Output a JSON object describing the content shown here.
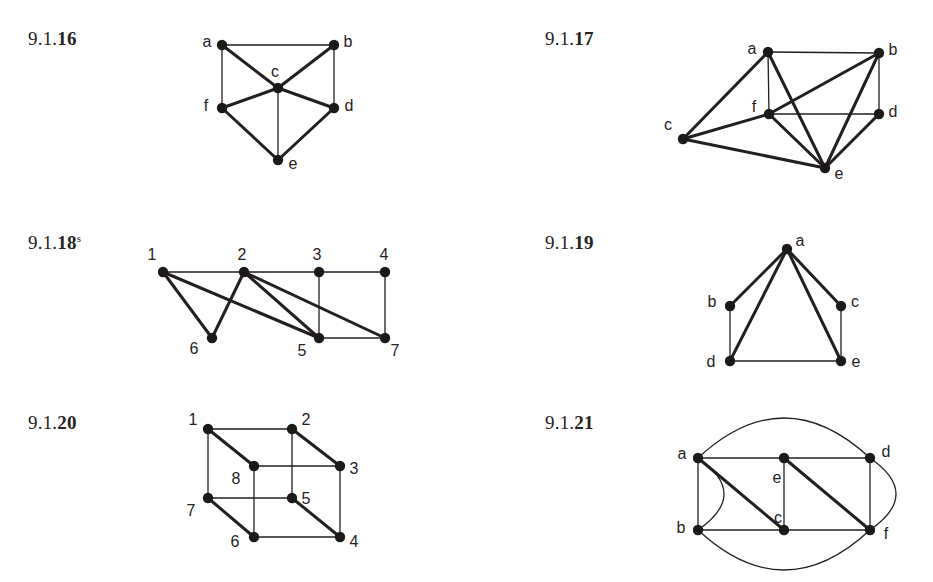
{
  "page": {
    "width": 933,
    "height": 582,
    "background": "#ffffff",
    "ink": "#231f20",
    "node_fill": "#1c1a18",
    "node_radius": 5.2,
    "thin_stroke": 1.3,
    "thick_stroke": 3.0
  },
  "figures": [
    {
      "id": "fig-9-1-16",
      "label_prefix": "9.1.",
      "label_number": "16",
      "label_sup": "",
      "label_x": 28,
      "label_y": 28,
      "vertices": [
        {
          "name": "a",
          "x": 222,
          "y": 45,
          "lx": 207,
          "ly": 43
        },
        {
          "name": "b",
          "x": 334,
          "y": 45,
          "lx": 348,
          "ly": 43
        },
        {
          "name": "c",
          "x": 278,
          "y": 88,
          "lx": 275,
          "ly": 73
        },
        {
          "name": "f",
          "x": 222,
          "y": 108,
          "lx": 206,
          "ly": 107
        },
        {
          "name": "d",
          "x": 334,
          "y": 108,
          "lx": 349,
          "ly": 107
        },
        {
          "name": "e",
          "x": 278,
          "y": 160,
          "lx": 293,
          "ly": 165
        }
      ],
      "edges": [
        {
          "from": "a",
          "to": "b",
          "w": "thin"
        },
        {
          "from": "a",
          "to": "f",
          "w": "thin"
        },
        {
          "from": "b",
          "to": "d",
          "w": "thin"
        },
        {
          "from": "a",
          "to": "c",
          "w": "thick"
        },
        {
          "from": "b",
          "to": "c",
          "w": "thick"
        },
        {
          "from": "c",
          "to": "f",
          "w": "thick"
        },
        {
          "from": "c",
          "to": "d",
          "w": "thick"
        },
        {
          "from": "c",
          "to": "e",
          "w": "thin"
        },
        {
          "from": "f",
          "to": "e",
          "w": "thick"
        },
        {
          "from": "d",
          "to": "e",
          "w": "thick"
        }
      ],
      "curves": []
    },
    {
      "id": "fig-9-1-17",
      "label_prefix": "9.1.",
      "label_number": "17",
      "label_sup": "",
      "label_x": 545,
      "label_y": 28,
      "vertices": [
        {
          "name": "a",
          "x": 768,
          "y": 52,
          "lx": 752,
          "ly": 50
        },
        {
          "name": "b",
          "x": 879,
          "y": 53,
          "lx": 893,
          "ly": 51
        },
        {
          "name": "c",
          "x": 683,
          "y": 139,
          "lx": 668,
          "ly": 126
        },
        {
          "name": "f",
          "x": 769,
          "y": 114,
          "lx": 754,
          "ly": 108
        },
        {
          "name": "d",
          "x": 879,
          "y": 114,
          "lx": 893,
          "ly": 113
        },
        {
          "name": "e",
          "x": 825,
          "y": 168,
          "lx": 839,
          "ly": 175
        }
      ],
      "edges": [
        {
          "from": "a",
          "to": "b",
          "w": "thin"
        },
        {
          "from": "a",
          "to": "f",
          "w": "thin"
        },
        {
          "from": "b",
          "to": "d",
          "w": "thin"
        },
        {
          "from": "f",
          "to": "d",
          "w": "thin"
        },
        {
          "from": "a",
          "to": "c",
          "w": "thick"
        },
        {
          "from": "a",
          "to": "e",
          "w": "thick"
        },
        {
          "from": "b",
          "to": "f",
          "w": "thick"
        },
        {
          "from": "b",
          "to": "e",
          "w": "thick"
        },
        {
          "from": "c",
          "to": "f",
          "w": "thick"
        },
        {
          "from": "c",
          "to": "e",
          "w": "thick"
        },
        {
          "from": "f",
          "to": "e",
          "w": "thick"
        },
        {
          "from": "d",
          "to": "e",
          "w": "thick"
        }
      ],
      "curves": []
    },
    {
      "id": "fig-9-1-18",
      "label_prefix": "9.1.",
      "label_number": "18",
      "label_sup": "s",
      "label_x": 28,
      "label_y": 232,
      "vertices": [
        {
          "name": "1",
          "x": 163,
          "y": 272,
          "lx": 152,
          "ly": 256
        },
        {
          "name": "2",
          "x": 244,
          "y": 272,
          "lx": 242,
          "ly": 256
        },
        {
          "name": "3",
          "x": 319,
          "y": 272,
          "lx": 317,
          "ly": 256
        },
        {
          "name": "4",
          "x": 385,
          "y": 272,
          "lx": 384,
          "ly": 256
        },
        {
          "name": "6",
          "x": 212,
          "y": 338,
          "lx": 194,
          "ly": 350
        },
        {
          "name": "5",
          "x": 319,
          "y": 338,
          "lx": 302,
          "ly": 352
        },
        {
          "name": "7",
          "x": 385,
          "y": 338,
          "lx": 395,
          "ly": 352
        }
      ],
      "edges": [
        {
          "from": "1",
          "to": "2",
          "w": "thin"
        },
        {
          "from": "2",
          "to": "3",
          "w": "thin"
        },
        {
          "from": "3",
          "to": "4",
          "w": "thin"
        },
        {
          "from": "3",
          "to": "5",
          "w": "thin"
        },
        {
          "from": "4",
          "to": "7",
          "w": "thin"
        },
        {
          "from": "5",
          "to": "7",
          "w": "thin"
        },
        {
          "from": "1",
          "to": "6",
          "w": "thick"
        },
        {
          "from": "2",
          "to": "6",
          "w": "thick"
        },
        {
          "from": "1",
          "to": "5",
          "w": "thick"
        },
        {
          "from": "2",
          "to": "5",
          "w": "thick"
        },
        {
          "from": "2",
          "to": "7",
          "w": "thick"
        }
      ],
      "curves": []
    },
    {
      "id": "fig-9-1-19",
      "label_prefix": "9.1.",
      "label_number": "19",
      "label_sup": "",
      "label_x": 545,
      "label_y": 232,
      "vertices": [
        {
          "name": "a",
          "x": 787,
          "y": 249,
          "lx": 800,
          "ly": 242
        },
        {
          "name": "b",
          "x": 730,
          "y": 306,
          "lx": 712,
          "ly": 303
        },
        {
          "name": "c",
          "x": 841,
          "y": 306,
          "lx": 855,
          "ly": 303
        },
        {
          "name": "d",
          "x": 730,
          "y": 361,
          "lx": 711,
          "ly": 363
        },
        {
          "name": "e",
          "x": 841,
          "y": 361,
          "lx": 856,
          "ly": 363
        }
      ],
      "edges": [
        {
          "from": "b",
          "to": "d",
          "w": "thin"
        },
        {
          "from": "c",
          "to": "e",
          "w": "thin"
        },
        {
          "from": "d",
          "to": "e",
          "w": "thin"
        },
        {
          "from": "a",
          "to": "b",
          "w": "thick"
        },
        {
          "from": "a",
          "to": "c",
          "w": "thick"
        },
        {
          "from": "a",
          "to": "d",
          "w": "thick"
        },
        {
          "from": "a",
          "to": "e",
          "w": "thick"
        }
      ],
      "curves": []
    },
    {
      "id": "fig-9-1-20",
      "label_prefix": "9.1.",
      "label_number": "20",
      "label_sup": "",
      "label_x": 28,
      "label_y": 412,
      "vertices": [
        {
          "name": "1",
          "x": 208,
          "y": 429,
          "lx": 193,
          "ly": 421
        },
        {
          "name": "2",
          "x": 292,
          "y": 429,
          "lx": 306,
          "ly": 421
        },
        {
          "name": "3",
          "x": 340,
          "y": 466,
          "lx": 354,
          "ly": 470
        },
        {
          "name": "8",
          "x": 254,
          "y": 466,
          "lx": 236,
          "ly": 480
        },
        {
          "name": "7",
          "x": 208,
          "y": 498,
          "lx": 191,
          "ly": 512
        },
        {
          "name": "5",
          "x": 292,
          "y": 498,
          "lx": 306,
          "ly": 500
        },
        {
          "name": "6",
          "x": 254,
          "y": 537,
          "lx": 235,
          "ly": 543
        },
        {
          "name": "4",
          "x": 340,
          "y": 537,
          "lx": 354,
          "ly": 543
        }
      ],
      "edges": [
        {
          "from": "1",
          "to": "2",
          "w": "thin"
        },
        {
          "from": "8",
          "to": "3",
          "w": "thin"
        },
        {
          "from": "1",
          "to": "7",
          "w": "thin"
        },
        {
          "from": "2",
          "to": "5",
          "w": "thin"
        },
        {
          "from": "8",
          "to": "6",
          "w": "thin"
        },
        {
          "from": "3",
          "to": "4",
          "w": "thin"
        },
        {
          "from": "7",
          "to": "5",
          "w": "thin"
        },
        {
          "from": "6",
          "to": "4",
          "w": "thin"
        },
        {
          "from": "1",
          "to": "8",
          "w": "thick"
        },
        {
          "from": "2",
          "to": "3",
          "w": "thick"
        },
        {
          "from": "7",
          "to": "6",
          "w": "thick"
        },
        {
          "from": "5",
          "to": "4",
          "w": "thick"
        }
      ],
      "curves": []
    },
    {
      "id": "fig-9-1-21",
      "label_prefix": "9.1.",
      "label_number": "21",
      "label_sup": "",
      "label_x": 545,
      "label_y": 412,
      "vertices": [
        {
          "name": "a",
          "x": 698,
          "y": 458,
          "lx": 682,
          "ly": 455
        },
        {
          "name": "e",
          "x": 784,
          "y": 458,
          "lx": 777,
          "ly": 479
        },
        {
          "name": "d",
          "x": 870,
          "y": 458,
          "lx": 886,
          "ly": 453
        },
        {
          "name": "b",
          "x": 698,
          "y": 530,
          "lx": 681,
          "ly": 529
        },
        {
          "name": "c",
          "x": 784,
          "y": 530,
          "lx": 778,
          "ly": 519
        },
        {
          "name": "f",
          "x": 870,
          "y": 530,
          "lx": 886,
          "ly": 535
        }
      ],
      "edges": [
        {
          "from": "a",
          "to": "e",
          "w": "thin"
        },
        {
          "from": "e",
          "to": "d",
          "w": "thin"
        },
        {
          "from": "a",
          "to": "b",
          "w": "thin"
        },
        {
          "from": "d",
          "to": "f",
          "w": "thin"
        },
        {
          "from": "b",
          "to": "c",
          "w": "thin"
        },
        {
          "from": "c",
          "to": "f",
          "w": "thin"
        },
        {
          "from": "e",
          "to": "c",
          "w": "thin"
        },
        {
          "from": "a",
          "to": "c",
          "w": "thick"
        },
        {
          "from": "e",
          "to": "f",
          "w": "thick"
        }
      ],
      "curves": [
        {
          "from": "a",
          "to": "d",
          "bow": -40,
          "w": "thin",
          "note": "top-arc"
        },
        {
          "from": "b",
          "to": "f",
          "bow": 40,
          "w": "thin",
          "note": "bottom-arc"
        },
        {
          "from": "a",
          "to": "b",
          "bow": -26,
          "w": "thin",
          "note": "parallel-edge-right-bulge"
        },
        {
          "from": "d",
          "to": "f",
          "bow": -26,
          "w": "thin",
          "note": "parallel-edge-right-bulge"
        }
      ]
    }
  ]
}
